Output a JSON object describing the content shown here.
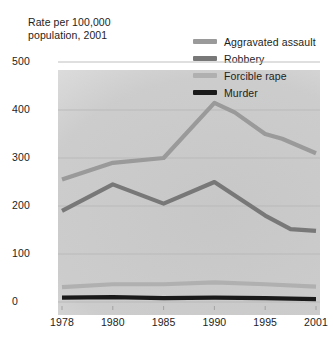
{
  "chart_data": {
    "type": "line",
    "title": "Rate per 100,000\npopulation, 2001",
    "xlabel": "",
    "ylabel": "Rate per 100,000 population, 2001",
    "x": [
      "1978",
      "1980",
      "1985",
      "1990",
      "1995",
      "2001"
    ],
    "categories": [
      "1978",
      "1980",
      "1985",
      "1990",
      "1995",
      "2001"
    ],
    "xtick_labels": [
      "1978",
      "1980",
      "1985",
      "1990",
      "1995",
      "2001"
    ],
    "ytick_labels": [
      "0",
      "100",
      "200",
      "300",
      "400",
      "500"
    ],
    "ytick_values": [
      0,
      100,
      200,
      300,
      400,
      500
    ],
    "ylim": [
      0,
      520
    ],
    "grid": "horizontal",
    "legend_position": "top-right",
    "series": [
      {
        "name": "Aggravated assault",
        "color": "#9a9a9a",
        "values": [
          255,
          290,
          300,
          415,
          350,
          310
        ],
        "points": [
          {
            "x": "1978",
            "y": 255
          },
          {
            "x": "1980",
            "y": 290
          },
          {
            "x": "1985",
            "y": 300
          },
          {
            "x": "1990",
            "y": 415
          },
          {
            "x": "1992",
            "y": 395
          },
          {
            "x": "1995",
            "y": 350
          },
          {
            "x": "1997",
            "y": 340
          },
          {
            "x": "2001",
            "y": 310
          }
        ]
      },
      {
        "name": "Robbery",
        "color": "#787878",
        "values": [
          190,
          245,
          205,
          250,
          180,
          148
        ],
        "points": [
          {
            "x": "1978",
            "y": 190
          },
          {
            "x": "1980",
            "y": 245
          },
          {
            "x": "1985",
            "y": 205
          },
          {
            "x": "1990",
            "y": 250
          },
          {
            "x": "1995",
            "y": 180
          },
          {
            "x": "1998",
            "y": 152
          },
          {
            "x": "2001",
            "y": 148
          }
        ]
      },
      {
        "name": "Forcible rape",
        "color": "#b0b0b0",
        "values": [
          31,
          37,
          37,
          41,
          37,
          32
        ],
        "points": [
          {
            "x": "1978",
            "y": 31
          },
          {
            "x": "1980",
            "y": 37
          },
          {
            "x": "1985",
            "y": 37
          },
          {
            "x": "1990",
            "y": 41
          },
          {
            "x": "1995",
            "y": 37
          },
          {
            "x": "2001",
            "y": 32
          }
        ]
      },
      {
        "name": "Murder",
        "color": "#1a1a1a",
        "values": [
          9,
          10,
          8,
          9,
          8,
          6
        ],
        "points": [
          {
            "x": "1978",
            "y": 9
          },
          {
            "x": "1980",
            "y": 10
          },
          {
            "x": "1985",
            "y": 8
          },
          {
            "x": "1990",
            "y": 9
          },
          {
            "x": "1995",
            "y": 8
          },
          {
            "x": "2001",
            "y": 6
          }
        ]
      }
    ]
  },
  "header": {
    "axis_title": "Rate per 100,000\npopulation, 2001"
  },
  "legend": {
    "items": [
      {
        "label": "Aggravated assault",
        "color": "#9a9a9a"
      },
      {
        "label": "Robbery",
        "color": "#787878"
      },
      {
        "label": "Forcible rape",
        "color": "#b0b0b0"
      },
      {
        "label": "Murder",
        "color": "#1a1a1a"
      }
    ]
  },
  "colors": {
    "grid": "#b8b8b8",
    "axis": "#9e9e9e",
    "text": "#1d1d1d",
    "background": "#ffffff",
    "watermark": "#c8c8c8"
  }
}
